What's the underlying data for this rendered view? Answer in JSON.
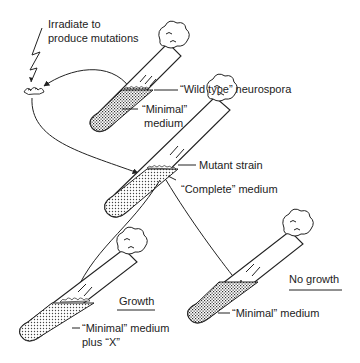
{
  "diagram": {
    "labels": {
      "irradiate_line1": "Irradiate to",
      "irradiate_line2": "produce mutations",
      "wild_type": "“Wild type” neurospora",
      "minimal_top_line1": "“Minimal”",
      "minimal_top_line2": "medium",
      "mutant_strain": "Mutant strain",
      "complete_medium": "“Complete” medium",
      "growth": "Growth",
      "minimal_plus_x_line1": "“Minimal” medium",
      "minimal_plus_x_line2": "plus “X”",
      "no_growth": "No growth",
      "minimal_bottom": "“Minimal” medium"
    },
    "colors": {
      "ink": "#222222",
      "background": "#ffffff"
    }
  }
}
